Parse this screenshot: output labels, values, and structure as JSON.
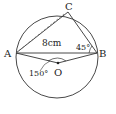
{
  "diagram": {
    "points": {
      "A": {
        "label": "A",
        "x": 16,
        "y": 53
      },
      "B": {
        "label": "B",
        "x": 97,
        "y": 53
      },
      "C": {
        "label": "C",
        "x": 68,
        "y": 12
      },
      "O": {
        "label": "O",
        "x": 58,
        "y": 63
      }
    },
    "circle": {
      "cx": 57,
      "cy": 57,
      "r": 42
    },
    "labels": {
      "ac_length": "8cm",
      "angle_b": "45°",
      "angle_aob": "150°"
    },
    "colors": {
      "stroke": "#333333",
      "background": "#ffffff"
    }
  }
}
